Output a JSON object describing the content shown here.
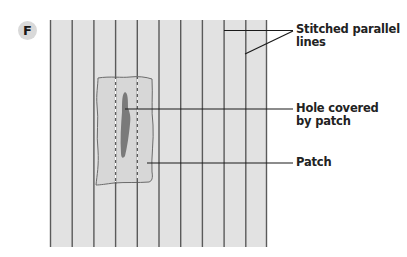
{
  "figure": {
    "panel_letter": "F",
    "fabric": {
      "x": 50,
      "y": 20,
      "width": 217,
      "height": 227,
      "fill": "#e2e2e2",
      "stitch_line_color": "#5a5a5a",
      "stitch_line_count": 11
    },
    "patch": {
      "fill": "#d6d6d6",
      "outline": "#6b6b6b",
      "dashed_stitch_color": "#ffffff"
    },
    "hole": {
      "fill": "#7a7a7a"
    },
    "labels": [
      {
        "id": "stitched-lines",
        "lines": [
          "Stitched parallel",
          "lines"
        ]
      },
      {
        "id": "hole",
        "lines": [
          "Hole covered",
          "by patch"
        ]
      },
      {
        "id": "patch",
        "lines": [
          "Patch"
        ]
      }
    ]
  }
}
